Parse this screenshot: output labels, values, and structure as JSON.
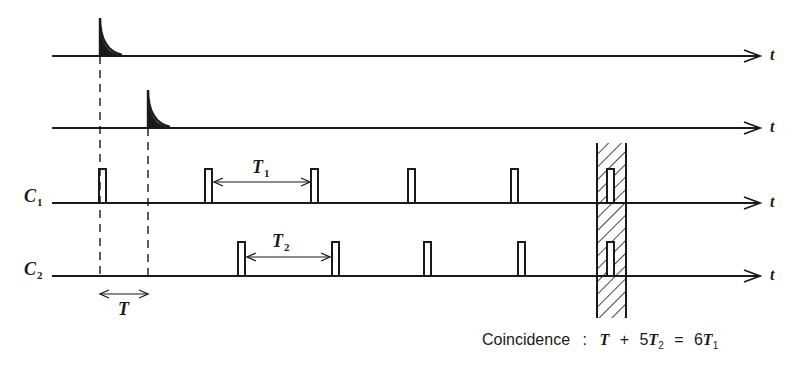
{
  "diagram": {
    "type": "timing-diagram",
    "axis_label": "t",
    "rows": [
      {
        "id": "trigger1",
        "label": "",
        "y": 56,
        "pulse_type": "decay-spike",
        "pulses_x": [
          100
        ]
      },
      {
        "id": "trigger2",
        "label": "",
        "y": 128,
        "pulse_type": "decay-spike",
        "pulses_x": [
          148
        ]
      },
      {
        "id": "C1",
        "label": "C",
        "label_sub": "1",
        "y": 203,
        "pulse_type": "rect",
        "pulses_x": [
          100,
          206,
          312,
          409,
          512,
          608
        ]
      },
      {
        "id": "C2",
        "label": "C",
        "label_sub": "2",
        "y": 276,
        "pulse_type": "rect",
        "pulses_x": [
          239,
          333,
          425,
          519,
          608
        ]
      }
    ],
    "intervals": [
      {
        "label": "T",
        "sub": "",
        "from_x": 100,
        "to_x": 148,
        "y": 294,
        "label_x": 118,
        "label_y": 300
      },
      {
        "label": "T",
        "sub": "1",
        "from_x": 214,
        "to_x": 310,
        "y": 182,
        "label_x": 252,
        "label_y": 158
      },
      {
        "label": "T",
        "sub": "2",
        "from_x": 247,
        "to_x": 330,
        "y": 257,
        "label_x": 272,
        "label_y": 232
      }
    ],
    "coincidence_region": {
      "x": 597,
      "width": 29,
      "y_top": 143,
      "y_bottom": 318
    },
    "caption": {
      "word": "Coincidence",
      "separator": ":",
      "equation": {
        "lhs_a": "T",
        "plus": "+",
        "coef_b": "5",
        "lhs_b": "T",
        "lhs_b_sub": "2",
        "equals": "=",
        "coef_c": "6",
        "rhs": "T",
        "rhs_sub": "1"
      }
    }
  }
}
